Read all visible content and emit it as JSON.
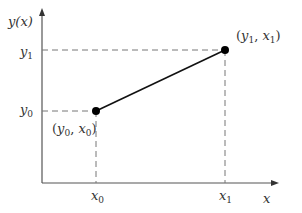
{
  "diagram": {
    "type": "linear-interpolation",
    "axes": {
      "y_label": "y(x)",
      "x_label": "x"
    },
    "ticks": {
      "y": [
        {
          "base": "y",
          "sub": "1"
        },
        {
          "base": "y",
          "sub": "0"
        }
      ],
      "x": [
        {
          "base": "x",
          "sub": "0"
        },
        {
          "base": "x",
          "sub": "1"
        }
      ]
    },
    "points": [
      {
        "label_open": "(",
        "a": "y",
        "a_sub": "0",
        "sep": ", ",
        "b": "x",
        "b_sub": "0",
        "label_close": ")"
      },
      {
        "label_open": "(",
        "a": "y",
        "a_sub": "1",
        "sep": ", ",
        "b": "x",
        "b_sub": "1",
        "label_close": ")"
      }
    ],
    "colors": {
      "axis": "#555555",
      "line": "#111111",
      "dash": "#777777",
      "point": "#000000"
    }
  }
}
